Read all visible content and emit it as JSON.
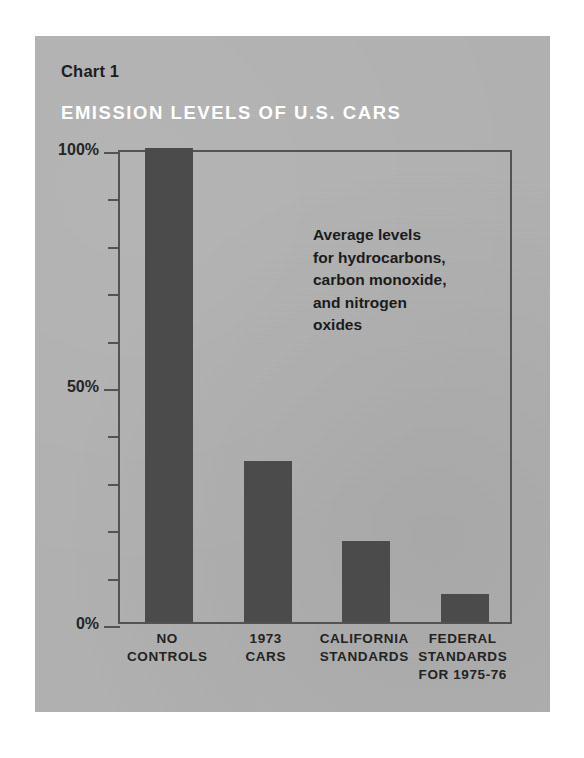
{
  "panel": {
    "background_color": "#b2b2b2",
    "bar_color": "#4b4b4b",
    "axis_color": "#535353",
    "title_color": "#ffffff",
    "text_color": "#232323"
  },
  "header": {
    "chart_number": "Chart 1",
    "title": "EMISSION LEVELS OF U.S. CARS"
  },
  "annotation": {
    "text": "Average levels\nfor hydrocarbons,\ncarbon monoxide,\nand nitrogen\noxides"
  },
  "axis": {
    "y_labels": [
      {
        "text": "100%",
        "value": 100
      },
      {
        "text": "50%",
        "value": 50
      },
      {
        "text": "0%",
        "value": 0
      }
    ],
    "y_ticks": [
      0,
      10,
      20,
      30,
      40,
      50,
      60,
      70,
      80,
      90,
      100
    ]
  },
  "chart_data": {
    "type": "bar",
    "title": "EMISSION LEVELS OF U.S. CARS",
    "subtitle": "Chart 1",
    "xlabel": "",
    "ylabel": "",
    "ylim": [
      0,
      100
    ],
    "grid": false,
    "legend": "none",
    "annotation": "Average levels for hydrocarbons, carbon monoxide, and nitrogen oxides",
    "categories": [
      "NO\nCONTROLS",
      "1973\nCARS",
      "CALIFORNIA\nSTANDARDS",
      "FEDERAL\nSTANDARDS\nFOR 1975-76"
    ],
    "values": [
      100,
      34,
      17,
      6
    ],
    "value_unit": "%",
    "tick_labels": [
      "0%",
      "50%",
      "100%"
    ]
  }
}
